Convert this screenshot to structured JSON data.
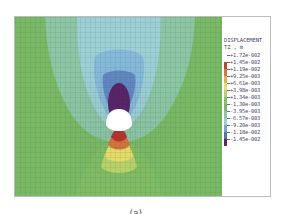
{
  "figure": {
    "legend": {
      "title_line1": "DISPLACEMENT",
      "title_line2": "TZ , m",
      "entries": [
        {
          "value": "+1.72e-002",
          "color": "#ffffff"
        },
        {
          "value": "+1.45e-002",
          "color": "#c8432c"
        },
        {
          "value": "+1.19e-002",
          "color": "#d9743a"
        },
        {
          "value": "+9.25e-003",
          "color": "#e6b04a"
        },
        {
          "value": "+6.61e-003",
          "color": "#e8dc6a"
        },
        {
          "value": "+3.98e-003",
          "color": "#b9d36a"
        },
        {
          "value": "+1.34e-003",
          "color": "#86c064"
        },
        {
          "value": "-1.30e-003",
          "color": "#79b965"
        },
        {
          "value": "-3.95e-003",
          "color": "#8cc6a4"
        },
        {
          "value": "-6.57e-003",
          "color": "#9ccfd6"
        },
        {
          "value": "-9.20e-003",
          "color": "#72a8d8"
        },
        {
          "value": "-1.18e-002",
          "color": "#5a6fb0"
        },
        {
          "value": "-1.45e-002",
          "color": "#5a2a6a"
        }
      ]
    },
    "colors": {
      "field_green": "#79b965",
      "light_blue": "#9ccfd6",
      "mid_blue": "#72a8d8",
      "deep_blue": "#5a7fc0",
      "purple": "#5a2168",
      "red": "#b8322a",
      "orange": "#d9743a",
      "yellow": "#e8dc6a",
      "opening": "#ffffff"
    }
  },
  "caption": "(a) ..."
}
